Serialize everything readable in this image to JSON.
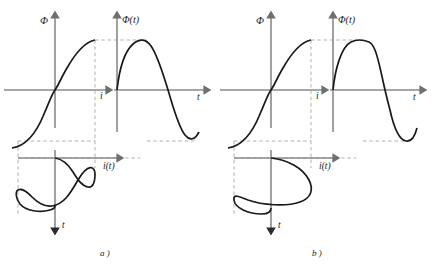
{
  "figure": {
    "type": "engineering-waveform-construction",
    "panels": [
      {
        "id": "a",
        "caption": "a )",
        "saturation": "sharp knee / deep saturation",
        "magnetization_curve": {
          "ylabel": "Φ",
          "xlabel": "i",
          "shape": "S-shaped saturating curve through origin",
          "knee": "abrupt"
        },
        "flux_waveform": {
          "label": "Φ(t)",
          "xlabel": "t",
          "shape": "sinusoid",
          "peaks_at": "saturation level"
        },
        "current_waveform": {
          "label": "i(t)",
          "xlabel": "t",
          "shape": "sharply peaked / spiky non-sinusoidal",
          "note": "narrow high peaks with flat shoulders"
        }
      },
      {
        "id": "b",
        "caption": "b )",
        "saturation": "gradual knee / moderate saturation",
        "magnetization_curve": {
          "ylabel": "Φ",
          "xlabel": "i",
          "shape": "S-shaped saturating curve through origin",
          "knee": "gradual"
        },
        "flux_waveform": {
          "label": "Φ(t)",
          "xlabel": "t",
          "shape": "flat-topped clipped sinusoid",
          "peaks_at": "saturation level"
        },
        "current_waveform": {
          "label": "i(t)",
          "xlabel": "t",
          "shape": "near-sinusoidal",
          "note": "broad smooth lobes"
        }
      }
    ],
    "axis_labels": {
      "flux": "Φ",
      "flux_of_t": "Φ(t)",
      "current": "i",
      "current_of_t": "i(t)",
      "time": "t"
    },
    "colors": {
      "curve": "#1a1a1a",
      "axis": "#8a8a8a",
      "dashed": "#a8a8a8",
      "background": "#ffffff"
    }
  }
}
